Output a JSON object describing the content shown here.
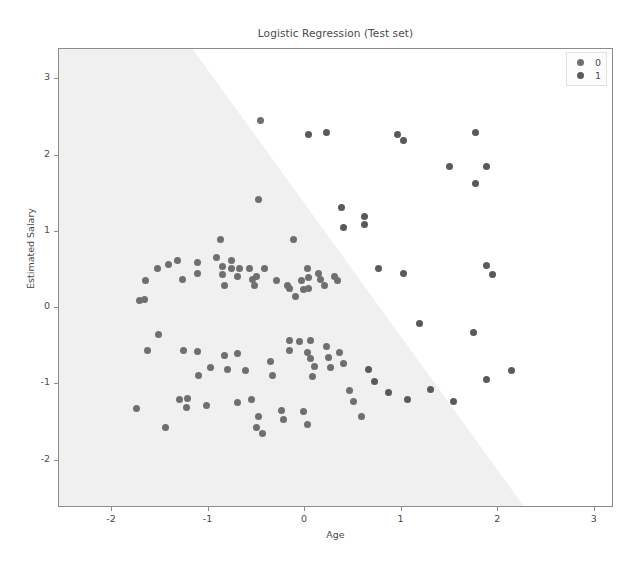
{
  "chart_data": {
    "type": "scatter",
    "title": "Logistic Regression (Test set)",
    "xlabel": "Age",
    "ylabel": "Estimated Salary",
    "xlim": [
      -2.55,
      3.2
    ],
    "ylim": [
      -2.62,
      3.4
    ],
    "xticks": [
      -2,
      -1,
      0,
      1,
      2,
      3
    ],
    "xticklabels": [
      "-2",
      "-1",
      "0",
      "1",
      "2",
      "3"
    ],
    "yticks": [
      -2,
      -1,
      0,
      1,
      2,
      3
    ],
    "yticklabels": [
      "-2",
      "-1",
      "0",
      "1",
      "2",
      "3"
    ],
    "grid": false,
    "legend": {
      "position": "upper right",
      "entries": [
        {
          "label": "0",
          "color": "#6f6f72"
        },
        {
          "label": "1",
          "color": "#5a5a5e"
        }
      ]
    },
    "decision_regions": {
      "description": "Logistic regression decision boundary; shaded region classified as 0, white region classified as 1",
      "region_0_color": "#f0f0f0",
      "region_1_color": "#ffffff",
      "boundary_points": [
        [
          -1.16,
          3.4
        ],
        [
          2.28,
          -2.62
        ]
      ]
    },
    "series": [
      {
        "name": "0",
        "color": "#6f6f72",
        "points": [
          [
            -1.65,
            0.37
          ],
          [
            -1.53,
            0.52
          ],
          [
            -1.42,
            0.58
          ],
          [
            -1.32,
            0.62
          ],
          [
            -1.66,
            0.12
          ],
          [
            -1.63,
            -0.56
          ],
          [
            -1.75,
            -1.32
          ],
          [
            -1.72,
            0.1
          ],
          [
            -1.52,
            -0.35
          ],
          [
            -1.27,
            0.38
          ],
          [
            -1.12,
            0.46
          ],
          [
            -1.12,
            0.6
          ],
          [
            -1.26,
            -0.56
          ],
          [
            -1.12,
            -0.57
          ],
          [
            -1.1,
            -0.88
          ],
          [
            -1.22,
            -1.18
          ],
          [
            -1.3,
            -1.2
          ],
          [
            -1.45,
            -1.56
          ],
          [
            -1.23,
            -1.3
          ],
          [
            -1.02,
            -1.28
          ],
          [
            -0.92,
            0.66
          ],
          [
            -0.86,
            0.55
          ],
          [
            -0.86,
            0.44
          ],
          [
            -0.88,
            0.9
          ],
          [
            -0.84,
            0.3
          ],
          [
            -0.76,
            0.52
          ],
          [
            -0.76,
            0.62
          ],
          [
            -0.68,
            0.52
          ],
          [
            -0.7,
            0.42
          ],
          [
            -0.58,
            0.52
          ],
          [
            -0.55,
            0.38
          ],
          [
            -0.5,
            0.42
          ],
          [
            -0.52,
            0.3
          ],
          [
            -0.42,
            0.52
          ],
          [
            -0.48,
            1.42
          ],
          [
            -0.44,
            -1.64
          ],
          [
            -0.98,
            -0.78
          ],
          [
            -0.84,
            -0.62
          ],
          [
            -0.8,
            -0.8
          ],
          [
            -0.7,
            -0.6
          ],
          [
            -0.62,
            -0.82
          ],
          [
            -0.56,
            -1.2
          ],
          [
            -0.48,
            -1.42
          ],
          [
            -0.5,
            -1.56
          ],
          [
            -0.36,
            -0.7
          ],
          [
            -0.34,
            -0.88
          ],
          [
            -0.24,
            -1.34
          ],
          [
            -0.22,
            -1.46
          ],
          [
            -0.3,
            0.36
          ],
          [
            -0.18,
            0.3
          ],
          [
            -0.16,
            0.26
          ],
          [
            -0.12,
            0.9
          ],
          [
            -0.1,
            0.16
          ],
          [
            -0.04,
            0.36
          ],
          [
            -0.02,
            0.25
          ],
          [
            0.02,
            0.52
          ],
          [
            0.04,
            0.4
          ],
          [
            0.04,
            0.26
          ],
          [
            0.06,
            -0.42
          ],
          [
            0.02,
            -0.58
          ],
          [
            0.06,
            -0.66
          ],
          [
            0.1,
            -0.76
          ],
          [
            0.08,
            -0.9
          ],
          [
            -0.06,
            -0.44
          ],
          [
            -0.16,
            -0.42
          ],
          [
            -0.16,
            -0.56
          ],
          [
            -0.02,
            -1.36
          ],
          [
            0.02,
            -1.52
          ],
          [
            0.14,
            0.46
          ],
          [
            0.16,
            0.38
          ],
          [
            0.2,
            0.3
          ],
          [
            0.22,
            -0.5
          ],
          [
            0.24,
            -0.64
          ],
          [
            0.26,
            -0.78
          ],
          [
            0.3,
            0.42
          ],
          [
            0.34,
            0.36
          ],
          [
            0.36,
            -0.58
          ],
          [
            0.4,
            -0.72
          ],
          [
            0.46,
            -1.08
          ],
          [
            0.5,
            -1.22
          ],
          [
            0.58,
            -1.42
          ],
          [
            -0.46,
            2.46
          ],
          [
            -0.7,
            -1.24
          ]
        ]
      },
      {
        "name": "1",
        "color": "#5a5a5e",
        "points": [
          [
            0.04,
            2.28
          ],
          [
            0.22,
            2.3
          ],
          [
            0.38,
            1.32
          ],
          [
            0.4,
            1.06
          ],
          [
            0.62,
            1.2
          ],
          [
            0.62,
            1.1
          ],
          [
            1.02,
            2.2
          ],
          [
            0.96,
            2.28
          ],
          [
            1.5,
            1.86
          ],
          [
            1.76,
            1.64
          ],
          [
            1.76,
            2.3
          ],
          [
            1.88,
            1.86
          ],
          [
            0.76,
            0.52
          ],
          [
            1.02,
            0.46
          ],
          [
            1.88,
            0.56
          ],
          [
            1.94,
            0.44
          ],
          [
            1.18,
            -0.2
          ],
          [
            1.74,
            -0.32
          ],
          [
            0.66,
            -0.8
          ],
          [
            0.72,
            -0.96
          ],
          [
            0.86,
            -1.1
          ],
          [
            1.06,
            -1.2
          ],
          [
            1.3,
            -1.06
          ],
          [
            1.54,
            -1.22
          ],
          [
            1.88,
            -0.94
          ],
          [
            2.14,
            -0.82
          ]
        ]
      }
    ]
  }
}
